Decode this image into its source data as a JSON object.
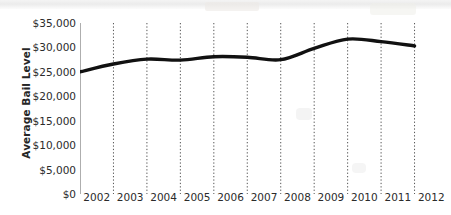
{
  "chart_data": {
    "type": "line",
    "title": "",
    "xlabel": "",
    "ylabel": "Average Bail Level",
    "categories": [
      "2002",
      "2003",
      "2004",
      "2005",
      "2006",
      "2007",
      "2008",
      "2009",
      "2010",
      "2011",
      "2012"
    ],
    "x_tick_labels": [
      "2002",
      "2003",
      "2004",
      "2005",
      "2006",
      "2007",
      "2008",
      "2009",
      "2010",
      "2011",
      "2012"
    ],
    "y_tick_labels": [
      "$35,000",
      "$30,000",
      "$25,000",
      "$20,000",
      "$15,000",
      "$10,000",
      "$5,000",
      "$0"
    ],
    "y_tick_values": [
      35000,
      30000,
      25000,
      20000,
      15000,
      10000,
      5000,
      0
    ],
    "ylim": [
      0,
      35000
    ],
    "values": [
      25000,
      26600,
      27600,
      27400,
      28100,
      28000,
      27500,
      29800,
      31700,
      31200,
      30300
    ],
    "series": [
      {
        "name": "Average Bail Level",
        "values": [
          25000,
          26600,
          27600,
          27400,
          28100,
          28000,
          27500,
          29800,
          31700,
          31200,
          30300
        ]
      }
    ],
    "line_color": "#111111",
    "grid": "vertical-dotted",
    "grid_color": "#555555",
    "legend": "none",
    "annotations": []
  },
  "axis": {
    "y_title": "Average Bail Level"
  }
}
